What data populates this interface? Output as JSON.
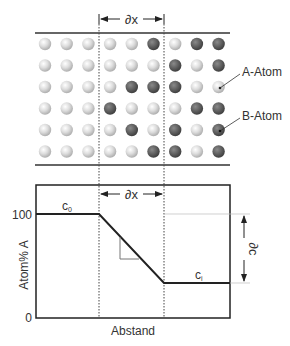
{
  "lattice": {
    "dx_label": "∂x",
    "legend": [
      {
        "label": "A-Atom",
        "type": "A"
      },
      {
        "label": "B-Atom",
        "type": "B"
      }
    ],
    "rows": [
      "AAAAABABB",
      "AAAAAABAB",
      "AAAABBBAA",
      "AAABAAABB",
      "AAAABABAB",
      "AAAAABBAB"
    ],
    "colors": {
      "A": "#d8d8d8",
      "B": "#606060"
    }
  },
  "chart_data": {
    "type": "line",
    "title": "",
    "xlabel": "Abstand",
    "ylabel": "Atom% A",
    "y_ticks": [
      "0",
      "100"
    ],
    "ylim": [
      0,
      100
    ],
    "points": [
      {
        "x": 0,
        "y": 100
      },
      {
        "x": 1,
        "y": 100
      },
      {
        "x": 2,
        "y": 33
      },
      {
        "x": 3,
        "y": 33
      }
    ],
    "annotations": {
      "c0": "c",
      "c0_sub": "0",
      "ci": "c",
      "ci_sub": "i",
      "dx": "∂x",
      "dc": "∂c"
    }
  }
}
